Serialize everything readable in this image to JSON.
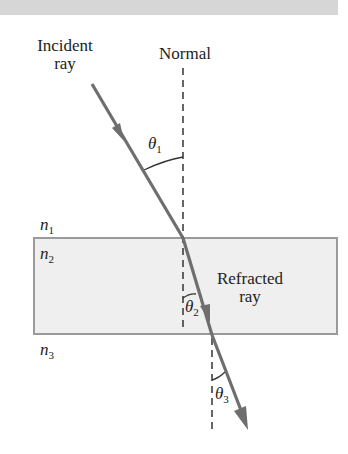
{
  "diagram": {
    "labels": {
      "incident_line1": "Incident",
      "incident_line2": "ray",
      "normal": "Normal",
      "refracted_line1": "Refracted",
      "refracted_line2": "ray"
    },
    "media": [
      {
        "symbol": "n",
        "sub": "1"
      },
      {
        "symbol": "n",
        "sub": "2"
      },
      {
        "symbol": "n",
        "sub": "3"
      }
    ],
    "angles": [
      {
        "symbol": "θ",
        "sub": "1"
      },
      {
        "symbol": "θ",
        "sub": "2"
      },
      {
        "symbol": "θ",
        "sub": "3"
      }
    ],
    "colors": {
      "ray": "#6e6e6e",
      "slab_fill": "#efefef",
      "slab_border": "#9a9a9a",
      "normal": "#333333",
      "header_bar": "#d6d6d6"
    }
  }
}
